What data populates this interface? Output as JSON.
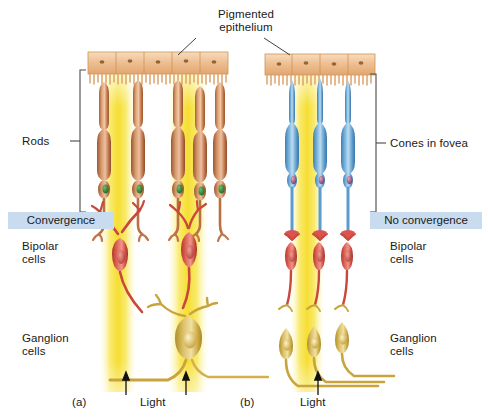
{
  "figure": {
    "title_top": "Pigmented\nepithelium",
    "labels": {
      "rods": "Rods",
      "cones": "Cones in fovea",
      "convergence": "Convergence",
      "no_convergence": "No convergence",
      "bipolar_left": "Bipolar\ncells",
      "bipolar_right": "Bipolar\ncells",
      "ganglion_left": "Ganglion\ncells",
      "ganglion_right": "Ganglion\ncells",
      "panel_a": "(a)",
      "panel_b": "(b)",
      "light_a": "Light",
      "light_b": "Light"
    },
    "colors": {
      "epithelium": "#e8b684",
      "epithelium_light": "#f6dcbe",
      "rod": "#c07a4e",
      "rod_light": "#dda77c",
      "cone": "#5b9bd0",
      "cone_light": "#a8cdea",
      "bipolar": "#d2483f",
      "bipolar_light": "#e8857c",
      "ganglion": "#c9a33c",
      "ganglion_light": "#e0c97a",
      "light_beam": "#f7e033",
      "band_bg": "#c9dcef",
      "text": "#1a1a1a",
      "bracket": "#4a4a4a",
      "nucleus_rod": "#2f7a34",
      "nucleus_cone": "#8e3b6a"
    },
    "counts": {
      "rods": 5,
      "cones": 3,
      "bipolar_left": 2,
      "bipolar_right": 3,
      "ganglion_left": 1,
      "ganglion_right": 3,
      "light_arrows_left": 2,
      "light_arrows_right": 1
    }
  }
}
